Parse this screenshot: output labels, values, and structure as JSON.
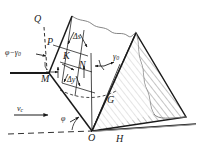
{
  "figure": {
    "type": "engineering-diagram",
    "background_color": "#ffffff",
    "line_color": "#1a1a1a",
    "hatch_color": "#555555",
    "terrain_color": "#777777",
    "width": 202,
    "height": 157
  },
  "labels": {
    "Q": "Q",
    "P": "P",
    "K": "K",
    "N": "N",
    "M": "M",
    "G": "G",
    "O": "O",
    "H": "H",
    "delta_s": "Δs",
    "delta_y": "Δy",
    "gamma_0": "γ",
    "gamma_0_sub": "0",
    "phi_minus_gamma_0": "φ−γ",
    "phi_minus_gamma_0_sub": "0",
    "phi": "φ",
    "v_c": "v",
    "v_c_sub": "c"
  },
  "geometry": {
    "points": {
      "Q": [
        40,
        23
      ],
      "P": [
        52,
        43
      ],
      "K": [
        68,
        57
      ],
      "N": [
        84,
        66
      ],
      "M": [
        49,
        73
      ],
      "G": [
        112,
        101
      ],
      "O": [
        92,
        131
      ],
      "H": [
        120,
        132
      ]
    },
    "wedge_apex_top": [
      72,
      16
    ],
    "ridge_peak_right": [
      136,
      33
    ],
    "base_right_end": [
      186,
      117
    ],
    "ground_line_y": 126,
    "horizontal_line_left_x": 10
  },
  "annotations": {
    "angle_gamma_0_arc": "arc between vertical ON and line OG",
    "angle_phi_arc": "arc at O between dashed baseline and line OM",
    "velocity_arrow": "horizontal arrow pointing right labelled v_c",
    "hatching": "diagonal hatch fill in right wedge O-ridge-base",
    "terrain_outline": "irregular wavy ground surface profile"
  }
}
